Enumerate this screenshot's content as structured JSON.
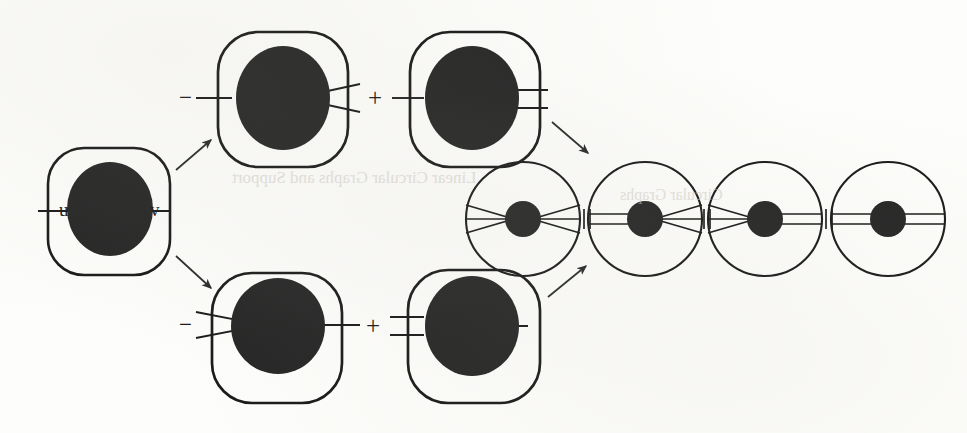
{
  "figure": {
    "background_color": "#fdfdfb",
    "ink_color": "#1a1a1a",
    "node_fill": "#262626",
    "source_node": {
      "shape": "rounded-square",
      "label_left": "u",
      "label_right": "v"
    },
    "branches": [
      {
        "id": "top-minus",
        "sign": "−",
        "shape": "rounded-square",
        "left_connector": "single-line",
        "right_connector": "fork"
      },
      {
        "id": "top-plus",
        "sign": "+",
        "shape": "rounded-square",
        "left_connector": "single-line",
        "right_connector": "double-line"
      },
      {
        "id": "bottom-minus",
        "sign": "−",
        "shape": "rounded-square",
        "left_connector": "fork",
        "right_connector": "single-line"
      },
      {
        "id": "bottom-plus",
        "sign": "+",
        "shape": "rounded-square",
        "left_connector": "double-line",
        "right_connector": "single-line"
      }
    ],
    "chain": {
      "separator": "+",
      "separators": [
        "+",
        "+",
        "+"
      ],
      "circles": [
        {
          "id": "chain-1",
          "shape": "circle",
          "left_connector": "fork",
          "right_connector": "fork"
        },
        {
          "id": "chain-2",
          "shape": "circle",
          "left_connector": "double-line",
          "right_connector": "fork"
        },
        {
          "id": "chain-3",
          "shape": "circle",
          "left_connector": "fork",
          "right_connector": "double-line"
        },
        {
          "id": "chain-4",
          "shape": "circle",
          "left_connector": "double-line",
          "right_connector": "double-line"
        }
      ]
    },
    "arrows": [
      {
        "id": "arrow-up-left",
        "direction": "up-right"
      },
      {
        "id": "arrow-down-left",
        "direction": "down-right"
      },
      {
        "id": "arrow-down-right",
        "direction": "down-right"
      },
      {
        "id": "arrow-up-right",
        "direction": "up-right"
      }
    ],
    "ghost_marks": [
      {
        "id": "ghost-1",
        "text": "Linear Circular Graphs and Support",
        "x": 230,
        "y": 178,
        "size": 17
      },
      {
        "id": "ghost-2",
        "text": "Circular Graphs",
        "x": 620,
        "y": 196,
        "size": 16
      }
    ]
  }
}
